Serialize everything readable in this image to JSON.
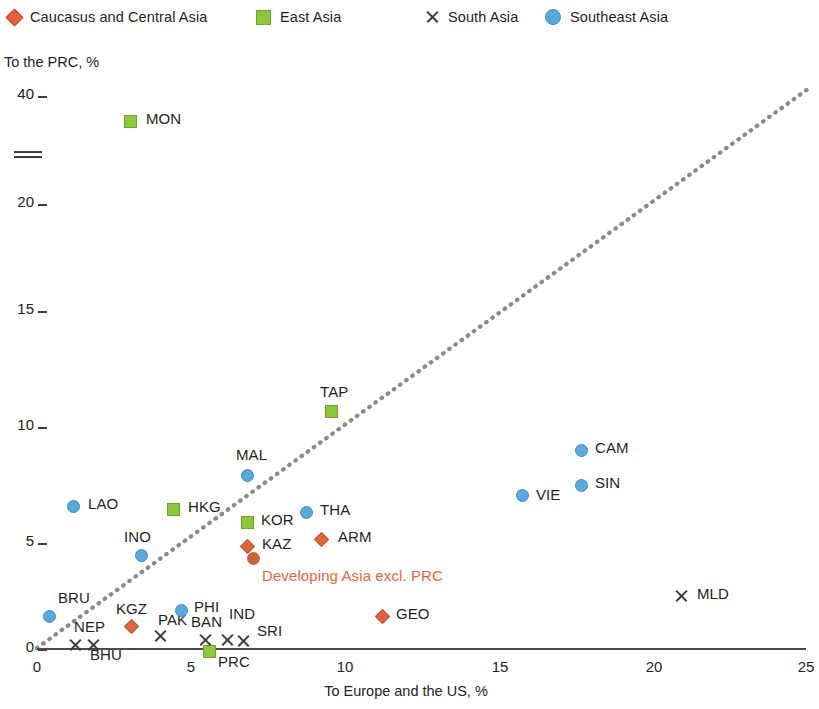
{
  "legend": {
    "items": [
      {
        "label": "Caucasus and Central Asia",
        "marker": "diamond-marker",
        "color": "#e2603c",
        "x": 8,
        "lx": 0
      },
      {
        "label": "East Asia",
        "marker": "square-marker",
        "color": "#8fc640",
        "x": 256,
        "lx": 0
      },
      {
        "label": "South Asia",
        "marker": "cross-marker",
        "color": "#3c3c3c",
        "x": 425,
        "lx": 0
      },
      {
        "label": "Southeast Asia",
        "marker": "circle-marker",
        "color": "#5aa9dd",
        "x": 545,
        "lx": 0
      }
    ]
  },
  "axes": {
    "y_title": "To the PRC, %",
    "x_title": "To Europe and the US, %",
    "y_ticks": [
      {
        "label": "40",
        "py": 95
      },
      {
        "label": "20",
        "py": 203
      },
      {
        "label": "15",
        "py": 310
      },
      {
        "label": "10",
        "py": 426
      },
      {
        "label": "5",
        "py": 542
      },
      {
        "label": "0",
        "py": 648
      }
    ],
    "x_ticks": [
      {
        "label": "0",
        "px": 37
      },
      {
        "label": "5",
        "px": 191
      },
      {
        "label": "10",
        "px": 345
      },
      {
        "label": "15",
        "px": 500
      },
      {
        "label": "20",
        "px": 654
      },
      {
        "label": "25",
        "px": 806
      }
    ],
    "axis_break": true
  },
  "annotation": {
    "highlight_label": "Developing Asia excl. PRC",
    "highlight_color": "#e2653f",
    "px": 262,
    "py": 565
  },
  "chart_data": {
    "type": "scatter",
    "title": "",
    "xlabel": "To Europe and the US, %",
    "ylabel": "To the PRC, %",
    "xlim": [
      0,
      25
    ],
    "ylim": [
      0,
      40
    ],
    "y_axis_break": {
      "between": [
        20,
        40
      ],
      "pixel_y": 154
    },
    "grid": false,
    "legend_position": "top",
    "reference_line": {
      "type": "dotted-diagonal",
      "from": [
        0,
        0
      ],
      "to": [
        25,
        40.8
      ],
      "color": "#8a8a8a",
      "style": "dotted"
    },
    "series": [
      {
        "name": "Caucasus and Central Asia",
        "marker": "diamond",
        "color": "#e2603c",
        "points": [
          {
            "code": "KAZ",
            "x": 6.2,
            "y": 4.6,
            "px": 246,
            "py": 545,
            "lx": 262,
            "ly": 545
          },
          {
            "code": "ARM",
            "x": 8.3,
            "y": 4.7,
            "px": 320,
            "py": 538,
            "lx": 338,
            "ly": 538
          },
          {
            "code": "KGZ",
            "x": 3.0,
            "y": 1.1,
            "px": 130,
            "py": 625,
            "lx": 116,
            "ly": 610
          },
          {
            "code": "GEO",
            "x": 11.3,
            "y": 1.4,
            "px": 381,
            "py": 615,
            "lx": 396,
            "ly": 615
          }
        ]
      },
      {
        "name": "East Asia",
        "marker": "square",
        "color": "#8fc640",
        "points": [
          {
            "code": "MON",
            "x": 3.0,
            "y": 39.0,
            "px": 129,
            "py": 120,
            "lx": 146,
            "ly": 120
          },
          {
            "code": "TAP",
            "x": 9.5,
            "y": 10.7,
            "px": 330,
            "py": 410,
            "lx": 320,
            "ly": 393
          },
          {
            "code": "HKG",
            "x": 4.4,
            "y": 6.5,
            "px": 172,
            "py": 508,
            "lx": 188,
            "ly": 508
          },
          {
            "code": "KOR",
            "x": 6.0,
            "y": 6.0,
            "px": 246,
            "py": 521,
            "lx": 261,
            "ly": 521
          },
          {
            "code": "PRC",
            "x": 5.9,
            "y": 0.0,
            "px": 208,
            "py": 650,
            "lx": 218,
            "ly": 663
          }
        ]
      },
      {
        "name": "South Asia",
        "marker": "cross",
        "color": "#3c3c3c",
        "points": [
          {
            "code": "NEP",
            "x": 1.5,
            "y": 0.0,
            "px": 75,
            "py": 645,
            "lx": 74,
            "ly": 628
          },
          {
            "code": "BHU",
            "x": 2.1,
            "y": 0.0,
            "px": 93,
            "py": 645,
            "lx": 90,
            "ly": 656
          },
          {
            "code": "PAK",
            "x": 3.9,
            "y": 0.5,
            "px": 160,
            "py": 636,
            "lx": 158,
            "ly": 621
          },
          {
            "code": "BAN",
            "x": 5.6,
            "y": 0.3,
            "px": 205,
            "py": 640,
            "lx": 191,
            "ly": 623
          },
          {
            "code": "IND",
            "x": 6.7,
            "y": 0.4,
            "px": 227,
            "py": 640,
            "lx": 229,
            "ly": 615
          },
          {
            "code": "SRI",
            "x": 7.2,
            "y": 0.4,
            "px": 243,
            "py": 641,
            "lx": 257,
            "ly": 632
          },
          {
            "code": "MLD",
            "x": 20.9,
            "y": 1.8,
            "px": 681,
            "py": 596,
            "lx": 697,
            "ly": 595
          }
        ]
      },
      {
        "name": "Southeast Asia",
        "marker": "circle",
        "color": "#5aa9dd",
        "points": [
          {
            "code": "LAO",
            "x": 1.2,
            "y": 6.5,
            "px": 72,
            "py": 505,
            "lx": 88,
            "ly": 505
          },
          {
            "code": "INO",
            "x": 3.4,
            "y": 4.3,
            "px": 140,
            "py": 554,
            "lx": 124,
            "ly": 538
          },
          {
            "code": "MAL",
            "x": 7.8,
            "y": 8.3,
            "px": 246,
            "py": 474,
            "lx": 236,
            "ly": 456
          },
          {
            "code": "THA",
            "x": 9.0,
            "y": 6.4,
            "px": 305,
            "py": 511,
            "lx": 320,
            "ly": 511
          },
          {
            "code": "BRU",
            "x": 0.4,
            "y": 1.9,
            "px": 48,
            "py": 615,
            "lx": 58,
            "ly": 599
          },
          {
            "code": "PHI",
            "x": 4.6,
            "y": 2.1,
            "px": 180,
            "py": 609,
            "lx": 194,
            "ly": 608
          },
          {
            "code": "CAM",
            "x": 17.6,
            "y": 9.2,
            "px": 580,
            "py": 449,
            "lx": 595,
            "ly": 449
          },
          {
            "code": "SIN",
            "x": 17.6,
            "y": 7.6,
            "px": 580,
            "py": 484,
            "lx": 595,
            "ly": 484
          },
          {
            "code": "VIE",
            "x": 15.7,
            "y": 7.1,
            "px": 521,
            "py": 494,
            "lx": 536,
            "ly": 496
          }
        ]
      },
      {
        "name": "Developing Asia excl. PRC",
        "marker": "bigdot",
        "color": "#c9643c",
        "points": [
          {
            "code": "",
            "x": 6.4,
            "y": 4.0,
            "px": 253,
            "py": 558,
            "lx": 262,
            "ly": 565
          }
        ]
      }
    ]
  }
}
